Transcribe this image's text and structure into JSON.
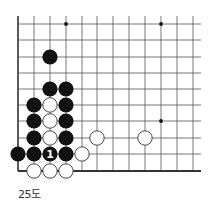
{
  "diagram": {
    "caption": "25도",
    "board": {
      "columns_x": [
        18,
        34,
        50,
        66,
        82,
        97,
        113,
        129,
        145,
        161,
        177,
        193
      ],
      "rows_y": [
        24,
        40,
        57,
        73,
        89,
        105,
        121,
        138,
        154,
        171
      ],
      "top_open_y": 16,
      "right_open_x": 201,
      "left_edge": true,
      "bottom_edge": true,
      "line_color": "#555555",
      "edge_color": "#333333",
      "star_points": [
        {
          "col": 3,
          "row": 0
        },
        {
          "col": 9,
          "row": 0
        },
        {
          "col": 9,
          "row": 6
        }
      ]
    },
    "stones": [
      {
        "color": "black",
        "col": 2,
        "row": 2
      },
      {
        "color": "black",
        "col": 2,
        "row": 4
      },
      {
        "color": "black",
        "col": 3,
        "row": 4
      },
      {
        "color": "black",
        "col": 1,
        "row": 5
      },
      {
        "color": "white",
        "col": 2,
        "row": 5
      },
      {
        "color": "black",
        "col": 3,
        "row": 5
      },
      {
        "color": "black",
        "col": 1,
        "row": 6
      },
      {
        "color": "white",
        "col": 2,
        "row": 6
      },
      {
        "color": "black",
        "col": 3,
        "row": 6
      },
      {
        "color": "black",
        "col": 1,
        "row": 7
      },
      {
        "color": "white",
        "col": 2,
        "row": 7
      },
      {
        "color": "black",
        "col": 3,
        "row": 7
      },
      {
        "color": "white",
        "col": 5,
        "row": 7
      },
      {
        "color": "white",
        "col": 8,
        "row": 7
      },
      {
        "color": "black",
        "col": 0,
        "row": 8
      },
      {
        "color": "black",
        "col": 1,
        "row": 8
      },
      {
        "color": "black",
        "col": 2,
        "row": 8,
        "label": "1"
      },
      {
        "color": "black",
        "col": 3,
        "row": 8
      },
      {
        "color": "white",
        "col": 4,
        "row": 8
      },
      {
        "color": "white",
        "col": 1,
        "row": 9
      },
      {
        "color": "white",
        "col": 2,
        "row": 9
      },
      {
        "color": "white",
        "col": 3,
        "row": 9
      }
    ],
    "stone_radius": 7.6,
    "colors": {
      "black_stone": "#111111",
      "white_stone": "#ffffff",
      "white_stone_stroke": "#333333",
      "marker_on_black": "#ffffff"
    }
  }
}
